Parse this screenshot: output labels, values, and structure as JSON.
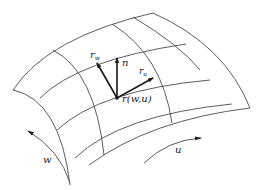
{
  "figure": {
    "labels": {
      "r_w": {
        "base": "r",
        "sub": "w"
      },
      "n": "n",
      "r_u": {
        "base": "r",
        "sub": "u"
      },
      "point": "r(w,u)",
      "w_direction": "w",
      "u_direction": "u"
    },
    "colors": {
      "line": "#4a4a4a",
      "vector": "#1a1a1a",
      "background": "#ffffff"
    }
  }
}
